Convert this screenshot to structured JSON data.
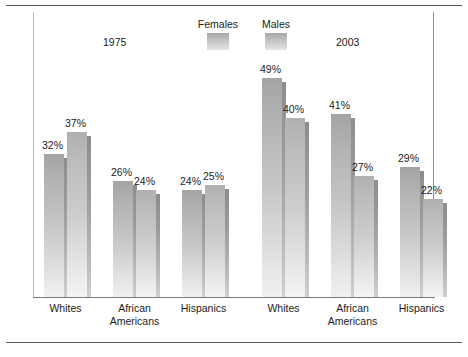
{
  "chart_data": {
    "type": "bar",
    "title": "",
    "xlabel": "",
    "ylabel": "",
    "ylim": [
      0,
      52
    ],
    "grid": false,
    "legend_position": "top-center",
    "legend": [
      "Females",
      "Males"
    ],
    "series": [
      {
        "name": "Females",
        "values": [
          32,
          26,
          24,
          49,
          41,
          29
        ]
      },
      {
        "name": "Males",
        "values": [
          37,
          24,
          25,
          40,
          27,
          22
        ]
      }
    ],
    "groups": [
      {
        "title": "1975",
        "categories": [
          "Whites",
          "African Americans",
          "Hispanics"
        ],
        "bars": [
          {
            "series": "Females",
            "category": "Whites",
            "value": 32,
            "label": "32%"
          },
          {
            "series": "Males",
            "category": "Whites",
            "value": 37,
            "label": "37%"
          },
          {
            "series": "Females",
            "category": "African Americans",
            "value": 26,
            "label": "26%"
          },
          {
            "series": "Males",
            "category": "African Americans",
            "value": 24,
            "label": "24%"
          },
          {
            "series": "Females",
            "category": "Hispanics",
            "value": 24,
            "label": "24%"
          },
          {
            "series": "Males",
            "category": "Hispanics",
            "value": 25,
            "label": "25%"
          }
        ]
      },
      {
        "title": "2003",
        "categories": [
          "Whites",
          "African Americans",
          "Hispanics"
        ],
        "bars": [
          {
            "series": "Females",
            "category": "Whites",
            "value": 49,
            "label": "49%"
          },
          {
            "series": "Males",
            "category": "Whites",
            "value": 40,
            "label": "40%"
          },
          {
            "series": "Females",
            "category": "African Americans",
            "value": 41,
            "label": "41%"
          },
          {
            "series": "Males",
            "category": "African Americans",
            "value": 27,
            "label": "27%"
          },
          {
            "series": "Females",
            "category": "Hispanics",
            "value": 29,
            "label": "29%"
          },
          {
            "series": "Males",
            "category": "Hispanics",
            "value": 22,
            "label": "22%"
          }
        ]
      }
    ],
    "category_labels": [
      {
        "line1": "Whites",
        "line2": ""
      },
      {
        "line1": "African",
        "line2": "Americans"
      },
      {
        "line1": "Hispanics",
        "line2": ""
      }
    ],
    "colors": {
      "females_bar": "#b4b4b4",
      "males_bar": "#c2c2c2",
      "shadow": "#8d8d8d",
      "text": "#1c1c1c",
      "axis": "#7a7a7a",
      "rule": "#595959"
    }
  }
}
